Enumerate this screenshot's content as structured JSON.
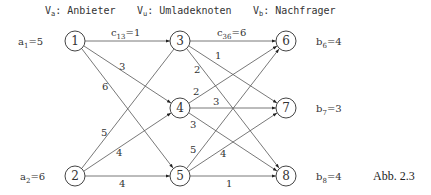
{
  "headers": {
    "supply": {
      "base": "V",
      "sub": "a",
      "text": ": Anbieter"
    },
    "transship": {
      "base": "V",
      "sub": "u",
      "text": ": Umladeknoten"
    },
    "demand": {
      "base": "V",
      "sub": "b",
      "text": ": Nachfrager"
    }
  },
  "nodes": [
    {
      "id": "1",
      "x": 75,
      "y": 41
    },
    {
      "id": "2",
      "x": 75,
      "y": 176
    },
    {
      "id": "3",
      "x": 180,
      "y": 41
    },
    {
      "id": "4",
      "x": 180,
      "y": 108
    },
    {
      "id": "5",
      "x": 180,
      "y": 176
    },
    {
      "id": "6",
      "x": 286,
      "y": 41
    },
    {
      "id": "7",
      "x": 286,
      "y": 108
    },
    {
      "id": "8",
      "x": 286,
      "y": 176
    }
  ],
  "edges": [
    {
      "from": "1",
      "to": "3",
      "cost": "1",
      "label": "c13=1"
    },
    {
      "from": "1",
      "to": "4",
      "cost": "3"
    },
    {
      "from": "1",
      "to": "5",
      "cost": "6"
    },
    {
      "from": "2",
      "to": "3",
      "cost": "5"
    },
    {
      "from": "2",
      "to": "4",
      "cost": "4"
    },
    {
      "from": "2",
      "to": "5",
      "cost": "4"
    },
    {
      "from": "3",
      "to": "6",
      "cost": "6",
      "label": "c36=6"
    },
    {
      "from": "3",
      "to": "7",
      "cost": "1"
    },
    {
      "from": "3",
      "to": "8",
      "cost": "2"
    },
    {
      "from": "4",
      "to": "6",
      "cost": "2"
    },
    {
      "from": "4",
      "to": "7",
      "cost": "3"
    },
    {
      "from": "4",
      "to": "8",
      "cost": "3"
    },
    {
      "from": "5",
      "to": "6",
      "cost": "5"
    },
    {
      "from": "5",
      "to": "7",
      "cost": "4"
    },
    {
      "from": "5",
      "to": "8",
      "cost": "1"
    }
  ],
  "supplies": [
    {
      "node": "1",
      "base": "a",
      "sub": "1",
      "value": "=5"
    },
    {
      "node": "2",
      "base": "a",
      "sub": "2",
      "value": "=6"
    }
  ],
  "demands": [
    {
      "node": "6",
      "base": "b",
      "sub": "6",
      "value": "=4"
    },
    {
      "node": "7",
      "base": "b",
      "sub": "7",
      "value": "=3"
    },
    {
      "node": "8",
      "base": "b",
      "sub": "8",
      "value": "=4"
    }
  ],
  "edge_labels": {
    "c13": {
      "base": "c",
      "sub": "13",
      "value": "=1"
    },
    "c36": {
      "base": "c",
      "sub": "36",
      "value": "=6"
    },
    "e14": "3",
    "e15": "6",
    "e23": "5",
    "e24": "4",
    "e25": "4",
    "e37": "1",
    "e38": "2",
    "e46": "2",
    "e47": "3",
    "e48": "3",
    "e56": "5",
    "e57": "4",
    "e58": "1"
  },
  "caption": "Abb. 2.3"
}
